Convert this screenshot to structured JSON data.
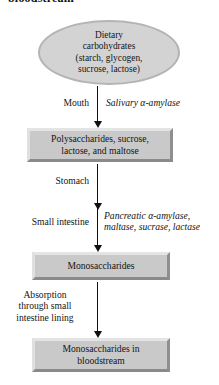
{
  "heading": {
    "text": "bloodstream",
    "note": "partially cropped at top edge of screenshot"
  },
  "diagram": {
    "colors": {
      "node_fill": "#c9c9c9",
      "ellipse_fill": "#d3d3d3",
      "bevel_light": "#e4e4e4",
      "bevel_dark": "#8a8a8a",
      "arrow": "#101010",
      "text": "#141414",
      "background": "#ffffff"
    },
    "ellipse": {
      "lines": [
        "Dietary",
        "carbohydrates",
        "(starch, glycogen,",
        "sucrose, lactose)"
      ]
    },
    "boxes": [
      {
        "id": "polysaccharides",
        "lines": [
          "Polysaccharides, sucrose,",
          "lactose, and maltose"
        ]
      },
      {
        "id": "monosaccharides",
        "lines": [
          "Monosaccharides"
        ]
      },
      {
        "id": "monosaccharides-blood",
        "lines": [
          "Monosaccharides in",
          "bloodstream"
        ]
      }
    ],
    "labels": {
      "mouth": "Mouth",
      "salivary_amylase": "Salivary α-amylase",
      "stomach": "Stomach",
      "small_intestine": "Small intestine",
      "pancreatic_enzymes": "Pancreatic α-amylase,\nmaltase, sucrase, lactase",
      "pancreatic_line1": "Pancreatic α-amylase,",
      "pancreatic_line2": "maltase, sucrase, lactase",
      "absorption": "Absorption\nthrough small\nintestine lining",
      "absorption_line1": "Absorption",
      "absorption_line2": "through small",
      "absorption_line3": "intestine lining"
    },
    "arrows": [
      {
        "id": "arrow-mouth",
        "from": "ellipse",
        "to": "polysaccharides"
      },
      {
        "id": "arrow-stomach",
        "from": "polysaccharides",
        "to": "small-intestine-stage"
      },
      {
        "id": "arrow-small-int",
        "from": "small-intestine-stage",
        "to": "monosaccharides"
      },
      {
        "id": "arrow-absorption",
        "from": "monosaccharides",
        "to": "monosaccharides-blood"
      }
    ]
  }
}
